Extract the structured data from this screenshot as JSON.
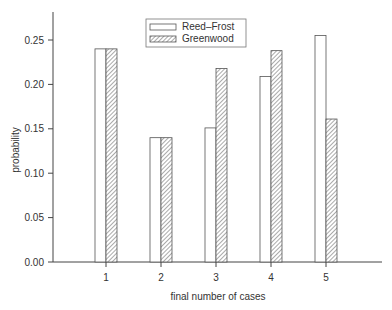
{
  "chart_data": {
    "type": "bar",
    "title": "",
    "xlabel": "final number of cases",
    "ylabel": "probability",
    "categories": [
      "1",
      "2",
      "3",
      "4",
      "5"
    ],
    "series": [
      {
        "name": "Reed–Frost",
        "pattern": "open",
        "values": [
          0.24,
          0.14,
          0.151,
          0.209,
          0.255
        ]
      },
      {
        "name": "Greenwood",
        "pattern": "hatched",
        "values": [
          0.24,
          0.14,
          0.218,
          0.238,
          0.161
        ]
      }
    ],
    "yticks": [
      "0.00",
      "0.05",
      "0.10",
      "0.15",
      "0.20",
      "0.25"
    ],
    "ylim": [
      0,
      0.28
    ],
    "grid": false,
    "legend_position": "top-center"
  },
  "legend": {
    "items": [
      "Reed–Frost",
      "Greenwood"
    ]
  },
  "axes": {
    "xlabel": "final number of cases",
    "ylabel": "probability"
  }
}
